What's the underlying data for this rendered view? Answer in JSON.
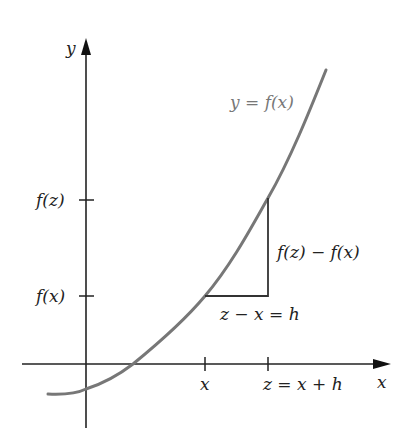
{
  "diagram": {
    "axes": {
      "x_label": "x",
      "y_label": "y"
    },
    "curve_label": "y = f(x)",
    "y_ticks": [
      {
        "label": "f(z)"
      },
      {
        "label": "f(x)"
      }
    ],
    "x_ticks": [
      {
        "label": "x"
      },
      {
        "label": "z = x + h"
      }
    ],
    "rise_label": "f(z) − f(x)",
    "run_label": "z − x = h",
    "colors": {
      "axis": "#222222",
      "curve": "#777777",
      "triangle": "#333333",
      "text": "#222222"
    }
  }
}
